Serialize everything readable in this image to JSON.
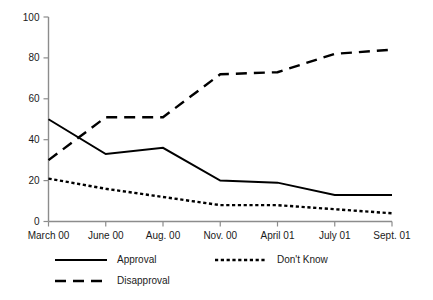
{
  "chart_data": {
    "type": "line",
    "title": "",
    "subtitle": "",
    "xlabel": "",
    "ylabel": "",
    "categories": [
      "March 00",
      "June 00",
      "Aug. 00",
      "Nov. 00",
      "April 01",
      "July 01",
      "Sept. 01"
    ],
    "ylim": [
      0,
      100
    ],
    "yticks": [
      0,
      20,
      40,
      60,
      80,
      100
    ],
    "grid": false,
    "legend_position": "bottom",
    "series": [
      {
        "name": "Approval",
        "style": "solid",
        "color": "#000000",
        "values": [
          50,
          33,
          36,
          20,
          19,
          13,
          13
        ]
      },
      {
        "name": "Disapproval",
        "style": "dashed",
        "color": "#000000",
        "values": [
          30,
          51,
          51,
          72,
          73,
          82,
          84
        ]
      },
      {
        "name": "Don't Know",
        "style": "dotted",
        "color": "#000000",
        "values": [
          21,
          16,
          12,
          8,
          8,
          6,
          4
        ]
      }
    ]
  },
  "axis": {
    "y_tick_labels": [
      "100",
      "80",
      "60",
      "40",
      "20",
      "0"
    ],
    "x_tick_labels": [
      "March 00",
      "June 00",
      "Aug. 00",
      "Nov. 00",
      "April 01",
      "July 01",
      "Sept. 01"
    ]
  },
  "legend": {
    "entries": [
      {
        "label": "Approval",
        "style": "solid"
      },
      {
        "label": "Don't Know",
        "style": "dotted"
      },
      {
        "label": "Disapproval",
        "style": "dashed"
      }
    ]
  }
}
